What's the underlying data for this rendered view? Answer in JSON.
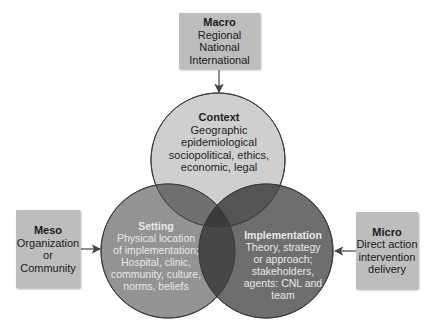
{
  "boxes": {
    "macro": {
      "title": "Macro",
      "lines": [
        "Regional",
        "National",
        "International"
      ]
    },
    "meso": {
      "title": "Meso",
      "lines": [
        "Organization",
        "or",
        "Community"
      ]
    },
    "micro": {
      "title": "Micro",
      "lines": [
        "Direct action",
        "intervention",
        "delivery"
      ]
    }
  },
  "circles": {
    "context": {
      "title": "Context",
      "lines": [
        "Geographic",
        "epidemiological",
        "sociopolitical, ethics,",
        "economic, legal"
      ]
    },
    "setting": {
      "title": "Setting",
      "lines": [
        "Physical location",
        "of implementation;",
        "Hospital, clinic,",
        "community, culture,",
        "norms, beliefs"
      ]
    },
    "implementation": {
      "title": "Implementation",
      "lines": [
        "Theory, strategy",
        "or approach;",
        "stakeholders,",
        "agents: CNL and",
        "team"
      ]
    }
  },
  "colors": {
    "box_fill": "#bdbdbd",
    "context_fill": "#cfcfcf",
    "setting_fill": "#8a8a8a",
    "implementation_fill": "#5e5e5e",
    "outline": "#3a3a3a"
  }
}
